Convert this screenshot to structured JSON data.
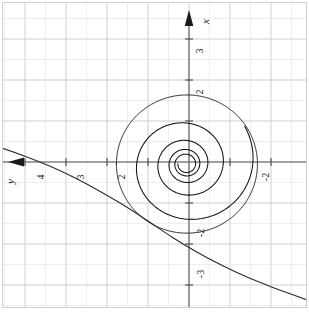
{
  "figure": {
    "title": "",
    "background": "#ffffff",
    "grid_color": "#c9c9c9",
    "grid_minor_color": "#e2e2e2",
    "axis_color": "#3a3a3a",
    "curve_color": "#111111",
    "orientation_note": "rotated-90-ccw-labels"
  },
  "axes": {
    "x_axis_label": "x",
    "y_axis_label": "y",
    "x_axis_label_position": "top",
    "y_axis_label_position": "left",
    "horizontal_axis_ticks": [
      "4",
      "3",
      "2",
      "-2"
    ],
    "vertical_axis_ticks": [
      "3",
      "2",
      "-2",
      "-3"
    ],
    "xlim": [
      -2.9,
      5.15
    ],
    "ylim": [
      -3.55,
      4.0
    ],
    "grid": true,
    "minor_grid_step": 0.5,
    "major_grid_step": 1
  },
  "chart_data": {
    "type": "line",
    "title": "",
    "xlabel": "y",
    "ylabel": "x",
    "xlim": [
      -2.9,
      5.15
    ],
    "ylim": [
      -3.55,
      4.0
    ],
    "grid": true,
    "legend": "none",
    "series": [
      {
        "name": "spiral-trajectory",
        "description": "inward spiral converging to focus near origin",
        "center": [
          0.07,
          -0.05
        ],
        "turns": 4.6,
        "r_start": 1.72,
        "r_end": 0.12,
        "decay": 0.62,
        "theta_start": 2.55,
        "color": "#111111",
        "linewidth": 1.0
      },
      {
        "name": "separatrix-curve",
        "description": "monotone decreasing curve from upper-left to lower-right",
        "points_x": [
          5.15,
          4.6,
          4.0,
          3.4,
          2.8,
          2.2,
          1.6,
          1.0,
          0.4,
          -0.2,
          -0.8,
          -1.4,
          -2.0,
          -2.6,
          -2.9
        ],
        "points_y": [
          0.52,
          0.35,
          0.14,
          -0.1,
          -0.38,
          -0.7,
          -1.05,
          -1.44,
          -1.84,
          -2.2,
          -2.52,
          -2.8,
          -3.04,
          -3.26,
          -3.37
        ],
        "color": "#2b2b2b",
        "linewidth": 1.0
      },
      {
        "name": "outer-ring",
        "description": "large outer loop of the spiral crossing the curve",
        "center": [
          0.05,
          -0.05
        ],
        "radius": 1.72,
        "color": "#111111",
        "linewidth": 0.9
      }
    ]
  }
}
